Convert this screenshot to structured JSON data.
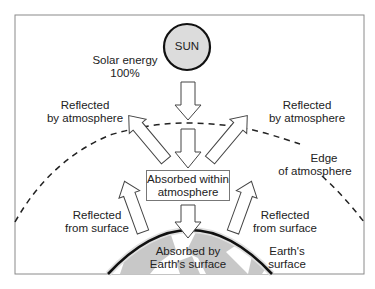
{
  "diagram": {
    "sun": {
      "label": "SUN",
      "fill": "#dcdcdc",
      "stroke": "#111111"
    },
    "solar_input": {
      "line1": "Solar energy",
      "line2": "100%"
    },
    "reflected_atmosphere_left": {
      "line1": "Reflected",
      "line2": "by atmosphere"
    },
    "reflected_atmosphere_right": {
      "line1": "Reflected",
      "line2": "by atmosphere"
    },
    "edge_label": {
      "line1": "Edge",
      "line2": "of atmosphere"
    },
    "absorbed_atmosphere": {
      "line1": "Absorbed within",
      "line2": "atmosphere"
    },
    "reflected_surface_left": {
      "line1": "Reflected",
      "line2": "from surface"
    },
    "reflected_surface_right": {
      "line1": "Reflected",
      "line2": "from surface"
    },
    "absorbed_surface": {
      "line1": "Absorbed by",
      "line2": "Earth's surface"
    },
    "earth_label": {
      "line1": "Earth's",
      "line2": "surface"
    },
    "colors": {
      "frame": "#8a8a8a",
      "land": "#c8c8c8",
      "earth_outline": "#111111",
      "arrow_stroke": "#444444"
    }
  }
}
